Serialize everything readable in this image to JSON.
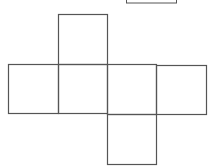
{
  "diagram": {
    "type": "cube-net",
    "stroke_color": "#555555",
    "background": "#ffffff",
    "partial_box": {
      "x": 126,
      "y": -10,
      "w": 50,
      "h": 13
    },
    "squares": [
      {
        "id": "top",
        "x": 58,
        "y": 14,
        "w": 49,
        "h": 50
      },
      {
        "id": "row-1",
        "x": 8,
        "y": 64,
        "w": 50,
        "h": 49
      },
      {
        "id": "row-2",
        "x": 58,
        "y": 64,
        "w": 49,
        "h": 49
      },
      {
        "id": "row-3",
        "x": 107,
        "y": 64,
        "w": 49,
        "h": 50
      },
      {
        "id": "row-4",
        "x": 156,
        "y": 65,
        "w": 50,
        "h": 49
      },
      {
        "id": "bottom",
        "x": 107,
        "y": 114,
        "w": 49,
        "h": 50
      }
    ]
  }
}
